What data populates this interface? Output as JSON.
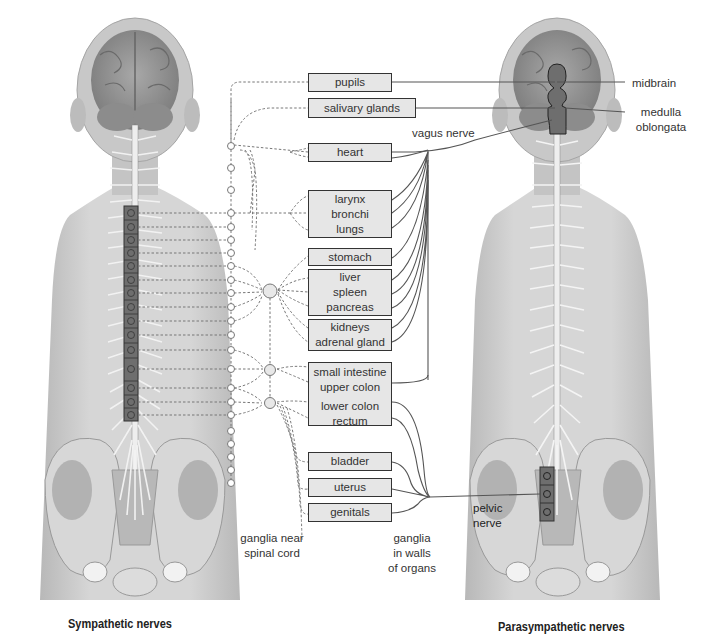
{
  "diagram": {
    "title_left": "Sympathetic nerves",
    "title_right": "Parasympathetic nerves",
    "colors": {
      "background": "#ffffff",
      "body_gray": "#c9c9c9",
      "organ_fill": "#e6e6e6",
      "ganglion_box": "#6e6e6e",
      "line": "#555555",
      "text": "#333333"
    },
    "organs": [
      {
        "id": "pupils",
        "lines": [
          "pupils"
        ]
      },
      {
        "id": "salivary-glands",
        "lines": [
          "salivary glands"
        ]
      },
      {
        "id": "heart",
        "lines": [
          "heart"
        ]
      },
      {
        "id": "larynx-bronchi-lungs",
        "lines": [
          "larynx",
          "bronchi",
          "lungs"
        ]
      },
      {
        "id": "stomach",
        "lines": [
          "stomach"
        ]
      },
      {
        "id": "liver-spleen-pancreas",
        "lines": [
          "liver",
          "spleen",
          "pancreas"
        ]
      },
      {
        "id": "kidneys-adrenal",
        "lines": [
          "kidneys",
          "adrenal gland"
        ]
      },
      {
        "id": "intestine-colon",
        "lines": [
          "small intestine",
          "upper colon",
          "lower colon",
          "rectum"
        ]
      },
      {
        "id": "bladder",
        "lines": [
          "bladder"
        ]
      },
      {
        "id": "uterus",
        "lines": [
          "uterus"
        ]
      },
      {
        "id": "genitals",
        "lines": [
          "genitals"
        ]
      }
    ],
    "labels": {
      "vagus_nerve": "vagus nerve",
      "midbrain": "midbrain",
      "medulla_line1": "medulla",
      "medulla_line2": "oblongata",
      "pelvic_line1": "pelvic",
      "pelvic_line2": "nerve",
      "ganglia_near_line1": "ganglia near",
      "ganglia_near_line2": "spinal cord",
      "ganglia_walls_line1": "ganglia",
      "ganglia_walls_line2": "in walls",
      "ganglia_walls_line3": "of organs"
    },
    "sympathetic_spinal_segments": 15,
    "sympathetic_chain_ganglia": 22,
    "parasympathetic_sacral_segments": 3
  }
}
